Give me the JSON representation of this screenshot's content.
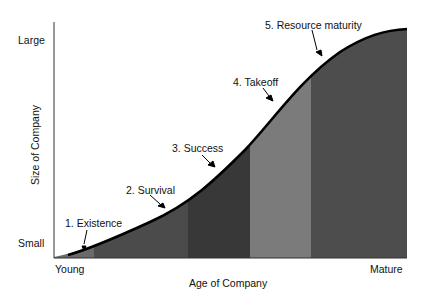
{
  "diagram": {
    "type": "s-curve-stages",
    "y_axis": {
      "title": "Size of Company",
      "top_label": "Large",
      "bottom_label": "Small"
    },
    "x_axis": {
      "title": "Age of Company",
      "left_label": "Young",
      "right_label": "Mature"
    },
    "stages": [
      {
        "label": "1. Existence",
        "color": "#6a6a6a"
      },
      {
        "label": "2. Survival",
        "color": "#4b4b4b"
      },
      {
        "label": "3. Success",
        "color": "#383838"
      },
      {
        "label": "4. Takeoff",
        "color": "#7b7b7b"
      },
      {
        "label": "5. Resource maturity",
        "color": "#4d4d4d"
      }
    ],
    "curve_color": "#000000"
  }
}
